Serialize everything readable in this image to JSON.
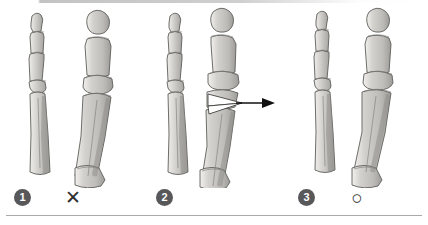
{
  "figure": {
    "panel_count": 3,
    "background_color": "#ffffff",
    "bone_fill_color": "#c8c7c3",
    "bone_outline_color": "#5e5d5a",
    "bone_shadow_color": "#9a9995",
    "badge_color": "#58585a",
    "badge_text_color": "#ffffff",
    "marker_color": "#2f2f2f",
    "arrow_color": "#111111",
    "rule_color": "#a9a9a9"
  },
  "panels": [
    {
      "number": "1",
      "verdict_symbol": "✕",
      "verdict_name": "cross-mark",
      "has_arrow": false,
      "has_wedge": false,
      "description": "Deviated first metatarsal and hallux phalanges shown in uncorrected hallux valgus alignment"
    },
    {
      "number": "2",
      "verdict_symbol": "",
      "verdict_name": "none",
      "has_arrow": true,
      "has_wedge": true,
      "description": "Osteotomy wedge cut at the distal first metatarsal with arrow indicating direction of lateral displacement"
    },
    {
      "number": "3",
      "verdict_symbol": "○",
      "verdict_name": "circle-mark",
      "has_arrow": false,
      "has_wedge": false,
      "description": "Corrected alignment of the first metatarsal and hallux after osteotomy"
    }
  ]
}
